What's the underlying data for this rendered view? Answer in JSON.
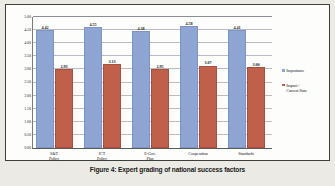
{
  "caption": "Figure 4: Expert grading of national success factors",
  "colors": {
    "importance": "#8ea5d4",
    "impact": "#c0604a",
    "grid": "#b9bcc2",
    "frame": "#3f3f3f",
    "background": "#fdfdfc"
  },
  "legend": {
    "position": "right",
    "entries": [
      {
        "label": "Importance",
        "color": "#8ea5d4"
      },
      {
        "label": "Impact /\nCurrent State",
        "color": "#c0604a"
      }
    ]
  },
  "axis": {
    "y_ticks": [
      "0.00",
      "0.50",
      "1.00",
      "1.50",
      "2.00",
      "2.50",
      "3.00",
      "3.50",
      "4.00",
      "4.50",
      "5.00"
    ],
    "y_min": 0,
    "y_max": 5,
    "y_step": 0.5
  },
  "chart_data": {
    "type": "bar",
    "title": "Figure 4: Expert grading of national success factors",
    "xlabel": "",
    "ylabel": "",
    "ylim": [
      0,
      5
    ],
    "ytick_step": 0.5,
    "grid": true,
    "legend_position": "right",
    "categories": [
      "S&T\nPolicy",
      "ICT\nPolicy",
      "E-Gov.\nPlan",
      "Cooperation",
      "Standards"
    ],
    "category_labels_flat": [
      "S&T Policy",
      "ICT Policy",
      "E-Gov. Plan",
      "Cooperation",
      "Standards"
    ],
    "series": [
      {
        "name": "Importance",
        "color": "#8ea5d4",
        "values": [
          4.42,
          4.55,
          4.38,
          4.58,
          4.41
        ],
        "labels": [
          "4.42",
          "4.55",
          "4.38",
          "4.58",
          "4.41"
        ]
      },
      {
        "name": "Impact / Current State",
        "color": "#c0604a",
        "values": [
          2.93,
          3.13,
          2.95,
          3.07,
          3.0
        ],
        "labels": [
          "2.93",
          "3.13",
          "2.95",
          "3.07",
          "3.00"
        ]
      }
    ]
  }
}
